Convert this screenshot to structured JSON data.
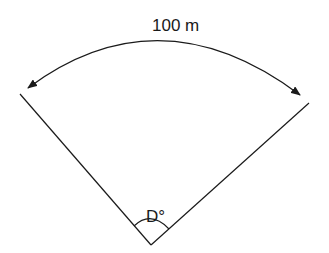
{
  "diagram": {
    "type": "circular-sector",
    "arc_label": "100 m",
    "radius_label_left": "R",
    "radius_label_right": "R",
    "angle_label": "D°",
    "colors": {
      "stroke": "#1a1a1a",
      "background": "#ffffff"
    }
  }
}
